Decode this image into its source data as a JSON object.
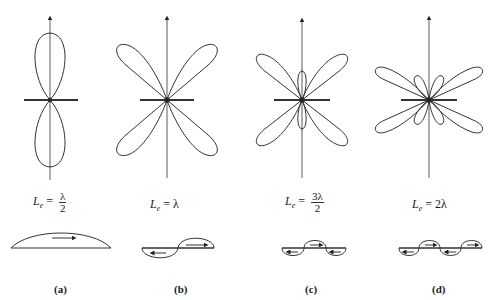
{
  "panels": [
    {
      "id": "a",
      "caption": "(a)",
      "length_label_prefix": "L",
      "length_subscript": "e",
      "eq": "=",
      "numerator": "λ",
      "denominator": "2",
      "value": "λ/2",
      "major_lobes": 2,
      "minor_lobes": 0
    },
    {
      "id": "b",
      "caption": "(b)",
      "length_label_prefix": "L",
      "length_subscript": "e",
      "eq": "=",
      "value": "λ",
      "major_lobes": 4,
      "minor_lobes": 0
    },
    {
      "id": "c",
      "caption": "(c)",
      "length_label_prefix": "L",
      "length_subscript": "e",
      "eq": "=",
      "numerator": "3λ",
      "denominator": "2",
      "value": "3λ/2",
      "major_lobes": 4,
      "minor_lobes": 2
    },
    {
      "id": "d",
      "caption": "(d)",
      "length_label_prefix": "L",
      "length_subscript": "e",
      "eq": "=",
      "value": "2λ",
      "major_lobes": 4,
      "minor_lobes": 4
    }
  ],
  "colors": {
    "stroke": "#333333",
    "background": "#ffffff"
  }
}
